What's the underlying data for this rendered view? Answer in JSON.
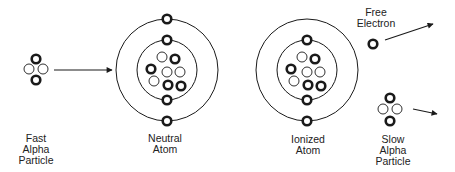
{
  "diagram": {
    "colors": {
      "stroke": "#1a1a1a",
      "proton_fill": "#ffffff",
      "neutron_fill": "#ffffff",
      "background": "#ffffff"
    },
    "labels": {
      "fast_alpha": [
        "Fast",
        "Alpha",
        "Particle"
      ],
      "neutral_atom": [
        "Neutral",
        "Atom"
      ],
      "ionized_atom": [
        "Ionized",
        "Atom"
      ],
      "free_electron": [
        "Free",
        "Electron"
      ],
      "slow_alpha": [
        "Slow",
        "Alpha",
        "Particle"
      ]
    },
    "fast_alpha_particle": {
      "particles": [
        {
          "type": "dark",
          "x": 36,
          "y": 59
        },
        {
          "type": "hollow",
          "x": 29,
          "y": 69
        },
        {
          "type": "hollow",
          "x": 43,
          "y": 69
        },
        {
          "type": "dark",
          "x": 36,
          "y": 80
        }
      ]
    },
    "neutral_atom": {
      "center": [
        167,
        70
      ],
      "orbits": [
        30,
        51
      ],
      "nucleus": [
        {
          "type": "hollow",
          "x": 162,
          "y": 57
        },
        {
          "type": "dark",
          "x": 175,
          "y": 59
        },
        {
          "type": "dark",
          "x": 151,
          "y": 69
        },
        {
          "type": "hollow",
          "x": 167,
          "y": 72
        },
        {
          "type": "hollow",
          "x": 180,
          "y": 72
        },
        {
          "type": "hollow",
          "x": 154,
          "y": 81
        },
        {
          "type": "dark",
          "x": 168,
          "y": 85
        },
        {
          "type": "dark",
          "x": 181,
          "y": 86
        }
      ],
      "electrons": [
        {
          "x": 167,
          "y": 19
        },
        {
          "x": 167,
          "y": 40
        },
        {
          "x": 167,
          "y": 100
        },
        {
          "x": 167,
          "y": 121
        }
      ]
    },
    "ionized_atom": {
      "center": [
        307,
        70
      ],
      "orbits": [
        30,
        51
      ],
      "nucleus": [
        {
          "type": "hollow",
          "x": 302,
          "y": 57
        },
        {
          "type": "dark",
          "x": 315,
          "y": 59
        },
        {
          "type": "dark",
          "x": 291,
          "y": 69
        },
        {
          "type": "hollow",
          "x": 307,
          "y": 72
        },
        {
          "type": "hollow",
          "x": 320,
          "y": 72
        },
        {
          "type": "hollow",
          "x": 294,
          "y": 81
        },
        {
          "type": "dark",
          "x": 308,
          "y": 85
        },
        {
          "type": "dark",
          "x": 321,
          "y": 86
        }
      ],
      "electrons": [
        {
          "x": 307,
          "y": 40
        },
        {
          "x": 307,
          "y": 100
        },
        {
          "x": 307,
          "y": 121
        }
      ]
    },
    "free_electron": {
      "x": 373,
      "y": 44
    },
    "slow_alpha_particle": {
      "particles": [
        {
          "type": "dark",
          "x": 390,
          "y": 98
        },
        {
          "type": "hollow",
          "x": 383,
          "y": 109
        },
        {
          "type": "hollow",
          "x": 397,
          "y": 109
        },
        {
          "type": "dark",
          "x": 390,
          "y": 121
        }
      ]
    },
    "arrows": [
      {
        "name": "fast-alpha-arrow",
        "x1": 54,
        "y1": 70,
        "x2": 112,
        "y2": 70
      },
      {
        "name": "free-electron-arrow",
        "x1": 385,
        "y1": 40,
        "x2": 433,
        "y2": 24
      },
      {
        "name": "slow-alpha-arrow",
        "x1": 413,
        "y1": 109,
        "x2": 437,
        "y2": 114
      }
    ]
  }
}
